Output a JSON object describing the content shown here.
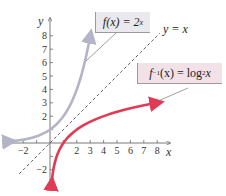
{
  "chart_data": {
    "type": "line",
    "title": "",
    "xlabel": "x",
    "ylabel": "y",
    "xlim": [
      -3,
      8.5
    ],
    "ylim": [
      -3,
      9
    ],
    "grid": false,
    "x_tick_labels": [
      "-2",
      "2",
      "3",
      "4",
      "5",
      "6",
      "7",
      "8"
    ],
    "x_tick_values": [
      -2,
      -1,
      1,
      2,
      3,
      4,
      5,
      6,
      7,
      8
    ],
    "y_tick_labels": [
      "8",
      "7",
      "6",
      "5",
      "4",
      "3",
      "2",
      "-2"
    ],
    "y_tick_values": [
      8,
      7,
      6,
      5,
      4,
      3,
      2,
      1,
      -1,
      -2
    ],
    "series": [
      {
        "name": "f(x) = 2^x",
        "color": "#b4b4c8",
        "style": "solid",
        "function": "2^x",
        "x_range": [
          -3,
          3
        ],
        "points": [
          [
            -3,
            0.125
          ],
          [
            -2,
            0.25
          ],
          [
            -1,
            0.5
          ],
          [
            0,
            1
          ],
          [
            1,
            2
          ],
          [
            2,
            4
          ],
          [
            3,
            8
          ]
        ]
      },
      {
        "name": "f^-1(x) = log2 x",
        "color": "#e03a55",
        "style": "solid",
        "function": "log2(x)",
        "x_range": [
          0.125,
          8
        ],
        "points": [
          [
            0.125,
            -3
          ],
          [
            0.25,
            -2
          ],
          [
            0.5,
            -1
          ],
          [
            1,
            0
          ],
          [
            2,
            1
          ],
          [
            4,
            2
          ],
          [
            8,
            3
          ]
        ]
      },
      {
        "name": "y = x",
        "color": "#444444",
        "style": "dashed",
        "function": "x",
        "x_range": [
          -2.3,
          8.2
        ],
        "points": [
          [
            -2.3,
            -2.3
          ],
          [
            8.2,
            8.2
          ]
        ]
      }
    ],
    "annotations": [
      {
        "text": "f(x) = 2^x",
        "box_color": "#e9e9ee",
        "points_to": [
          2.6,
          6.1
        ]
      },
      {
        "text": "y = x"
      },
      {
        "text": "f^-1(x) = log2 x",
        "box_color": "#f2e2e8",
        "points_to": [
          8,
          3
        ]
      }
    ]
  },
  "labels": {
    "f_prefix": "f(x) = 2",
    "f_sup": "x",
    "finv_f": "f",
    "finv_sup": "−1",
    "finv_mid": "(x) = log",
    "finv_sub": "2",
    "finv_end": " x",
    "yx": "y = x",
    "x_axis": "x",
    "y_axis": "y"
  }
}
